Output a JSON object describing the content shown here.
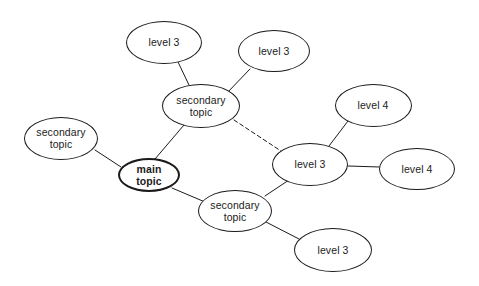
{
  "diagram": {
    "background_color": "#ffffff",
    "stroke_color": "#1b1b1b",
    "text_color": "#1b1b1b",
    "nodes": [
      {
        "id": "main-topic",
        "label": "main\ntopic",
        "kind": "main",
        "cx": 149,
        "cy": 175,
        "rx": 31,
        "ry": 17
      },
      {
        "id": "secondary-topic-left",
        "label": "secondary\ntopic",
        "kind": "secondary",
        "cx": 61,
        "cy": 138,
        "rx": 37,
        "ry": 21.5
      },
      {
        "id": "secondary-topic-top",
        "label": "secondary\ntopic",
        "kind": "secondary",
        "cx": 201,
        "cy": 106,
        "rx": 39,
        "ry": 22
      },
      {
        "id": "secondary-topic-bottom",
        "label": "secondary\ntopic",
        "kind": "secondary",
        "cx": 235,
        "cy": 211,
        "rx": 37,
        "ry": 21
      },
      {
        "id": "level-3-top-left",
        "label": "level 3",
        "kind": "level3",
        "cx": 164,
        "cy": 42,
        "rx": 38,
        "ry": 21.5
      },
      {
        "id": "level-3-top-right",
        "label": "level 3",
        "kind": "level3",
        "cx": 274,
        "cy": 51,
        "rx": 36,
        "ry": 21
      },
      {
        "id": "level-3-center-right",
        "label": "level 3",
        "kind": "level3",
        "cx": 310,
        "cy": 164,
        "rx": 38,
        "ry": 21.5
      },
      {
        "id": "level-3-bottom",
        "label": "level 3",
        "kind": "level3",
        "cx": 333,
        "cy": 250,
        "rx": 39,
        "ry": 22
      },
      {
        "id": "level-4-upper",
        "label": "level 4",
        "kind": "level4",
        "cx": 373,
        "cy": 105,
        "rx": 38.5,
        "ry": 21.5
      },
      {
        "id": "level-4-right",
        "label": "level 4",
        "kind": "level4",
        "cx": 417,
        "cy": 169,
        "rx": 38,
        "ry": 21
      }
    ],
    "edges": [
      {
        "id": "edge-main-to-secondary-left",
        "from": "secondary-topic-left",
        "to": "main-topic",
        "style": "solid",
        "x1": 95,
        "y1": 150,
        "x2": 121,
        "y2": 167
      },
      {
        "id": "edge-main-to-secondary-top",
        "from": "main-topic",
        "to": "secondary-topic-top",
        "style": "solid",
        "x1": 155,
        "y1": 159,
        "x2": 184,
        "y2": 125
      },
      {
        "id": "edge-main-to-secondary-bottom",
        "from": "main-topic",
        "to": "secondary-topic-bottom",
        "style": "solid",
        "x1": 172,
        "y1": 188,
        "x2": 205,
        "y2": 202
      },
      {
        "id": "edge-secondary-top-to-level-3-top-left",
        "from": "secondary-topic-top",
        "to": "level-3-top-left",
        "style": "solid",
        "x1": 189,
        "y1": 85,
        "x2": 178,
        "y2": 62
      },
      {
        "id": "edge-secondary-top-to-level-3-top-right",
        "from": "secondary-topic-top",
        "to": "level-3-top-right",
        "style": "solid",
        "x1": 227,
        "y1": 93,
        "x2": 250,
        "y2": 69
      },
      {
        "id": "edge-secondary-top-to-level-3-center-right",
        "from": "secondary-topic-top",
        "to": "level-3-center-right",
        "style": "dashed",
        "x1": 234,
        "y1": 120,
        "x2": 281,
        "y2": 151
      },
      {
        "id": "edge-level-3-center-right-to-level-4-upper",
        "from": "level-3-center-right",
        "to": "level-4-upper",
        "style": "solid",
        "x1": 329,
        "y1": 146,
        "x2": 348,
        "y2": 121
      },
      {
        "id": "edge-level-3-center-right-to-level-4-right",
        "from": "level-3-center-right",
        "to": "level-4-right",
        "style": "solid",
        "x1": 348,
        "y1": 166,
        "x2": 379,
        "y2": 167
      },
      {
        "id": "edge-secondary-bottom-to-level-3-center-right",
        "from": "secondary-topic-bottom",
        "to": "level-3-center-right",
        "style": "solid",
        "x1": 265,
        "y1": 196,
        "x2": 289,
        "y2": 180
      },
      {
        "id": "edge-secondary-bottom-to-level-3-bottom",
        "from": "secondary-topic-bottom",
        "to": "level-3-bottom",
        "style": "solid",
        "x1": 266,
        "y1": 222,
        "x2": 299,
        "y2": 239
      }
    ]
  }
}
